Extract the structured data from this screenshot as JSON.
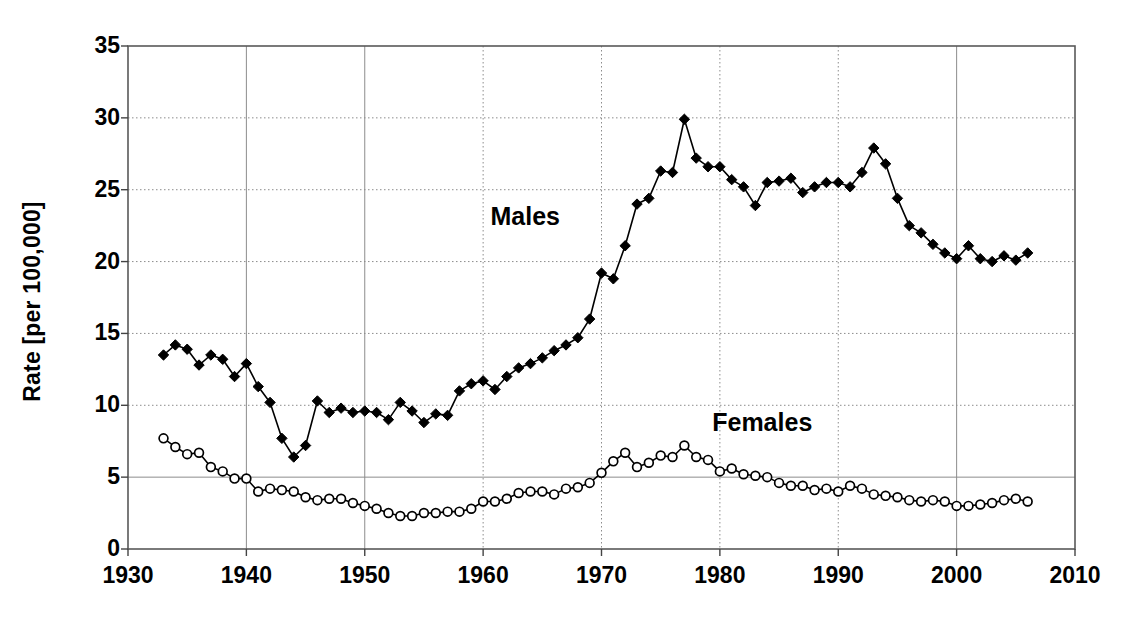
{
  "chart_data": {
    "type": "line",
    "title": "",
    "xlabel": "",
    "ylabel": "Rate [per 100,000]",
    "xlim": [
      1930,
      2010
    ],
    "ylim": [
      0,
      35
    ],
    "xticks": [
      1930,
      1940,
      1950,
      1960,
      1970,
      1980,
      1990,
      2000,
      2010
    ],
    "yticks": [
      0,
      5,
      10,
      15,
      20,
      25,
      30,
      35
    ],
    "grid": true,
    "legend_position": "inline-annotation",
    "annotations": [
      {
        "text": "Males",
        "x": 1964,
        "y": 23.0
      },
      {
        "text": "Females",
        "x": 1984,
        "y": 8.7
      }
    ],
    "x": [
      1933,
      1934,
      1935,
      1936,
      1937,
      1938,
      1939,
      1940,
      1941,
      1942,
      1943,
      1944,
      1945,
      1946,
      1947,
      1948,
      1949,
      1950,
      1951,
      1952,
      1953,
      1954,
      1955,
      1956,
      1957,
      1958,
      1959,
      1960,
      1961,
      1962,
      1963,
      1964,
      1965,
      1966,
      1967,
      1968,
      1969,
      1970,
      1971,
      1972,
      1973,
      1974,
      1975,
      1976,
      1977,
      1978,
      1979,
      1980,
      1981,
      1982,
      1983,
      1984,
      1985,
      1986,
      1987,
      1988,
      1989,
      1990,
      1991,
      1992,
      1993,
      1994,
      1995,
      1996,
      1997,
      1998,
      1999,
      2000,
      2001,
      2002,
      2003,
      2004,
      2005,
      2006
    ],
    "series": [
      {
        "name": "Males",
        "marker": "filled-diamond",
        "color": "#000000",
        "values": [
          13.5,
          14.2,
          13.9,
          12.8,
          13.5,
          13.2,
          12.0,
          12.9,
          11.3,
          10.2,
          7.7,
          6.4,
          7.2,
          10.3,
          9.5,
          9.8,
          9.5,
          9.6,
          9.5,
          9.0,
          10.2,
          9.6,
          8.8,
          9.4,
          9.3,
          11.0,
          11.5,
          11.7,
          11.1,
          12.0,
          12.6,
          12.9,
          13.3,
          13.8,
          14.2,
          14.7,
          16.0,
          19.2,
          18.8,
          21.1,
          24.0,
          24.4,
          26.3,
          26.2,
          29.9,
          27.2,
          26.6,
          26.6,
          25.7,
          25.2,
          23.9,
          25.5,
          25.6,
          25.8,
          24.8,
          25.2,
          25.5,
          25.5,
          25.2,
          26.2,
          27.9,
          26.8,
          24.4,
          22.5,
          22.0,
          21.2,
          20.6,
          20.2,
          21.1,
          20.2,
          20.0,
          20.4,
          20.1,
          20.6
        ]
      },
      {
        "name": "Females",
        "marker": "open-circle",
        "color": "#000000",
        "values": [
          7.7,
          7.1,
          6.6,
          6.7,
          5.7,
          5.4,
          4.9,
          4.9,
          4.0,
          4.2,
          4.1,
          4.0,
          3.6,
          3.4,
          3.5,
          3.5,
          3.2,
          3.0,
          2.8,
          2.5,
          2.3,
          2.3,
          2.5,
          2.5,
          2.6,
          2.6,
          2.8,
          3.3,
          3.3,
          3.5,
          3.9,
          4.0,
          4.0,
          3.8,
          4.2,
          4.3,
          4.6,
          5.3,
          6.1,
          6.7,
          5.7,
          6.0,
          6.5,
          6.4,
          7.2,
          6.4,
          6.2,
          5.4,
          5.6,
          5.2,
          5.1,
          5.0,
          4.6,
          4.4,
          4.4,
          4.1,
          4.2,
          4.0,
          4.4,
          4.2,
          3.8,
          3.7,
          3.6,
          3.4,
          3.3,
          3.4,
          3.3,
          3.0,
          3.0,
          3.1,
          3.2,
          3.4,
          3.5,
          3.3
        ]
      }
    ]
  }
}
